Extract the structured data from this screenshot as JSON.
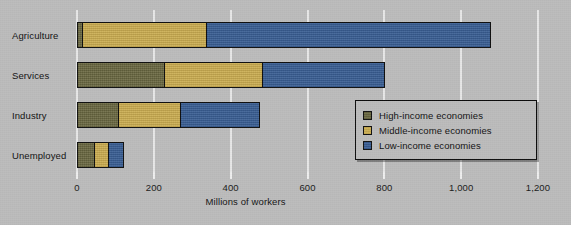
{
  "chart_data": {
    "type": "bar",
    "orientation": "horizontal",
    "stacked": true,
    "title": "",
    "xlabel": "Millions of workers",
    "ylabel": "",
    "xlim": [
      0,
      1200
    ],
    "xticks": [
      0,
      200,
      400,
      600,
      800,
      1000,
      1200
    ],
    "xtick_labels": [
      "0",
      "200",
      "400",
      "600",
      "800",
      "1,000",
      "1,200"
    ],
    "grid": true,
    "legend_position": "center-right",
    "categories": [
      "Agriculture",
      "Services",
      "Industry",
      "Unemployed"
    ],
    "series": [
      {
        "name": "High-income economies",
        "color": "#6b6942",
        "values": [
          10,
          226,
          104,
          44
        ]
      },
      {
        "name": "Middle-income economies",
        "color": "#cfb052",
        "values": [
          325,
          255,
          164,
          37
        ]
      },
      {
        "name": "Low-income economies",
        "color": "#3a5f96",
        "values": [
          742,
          320,
          208,
          41
        ]
      }
    ],
    "totals": [
      1077,
      801,
      476,
      122
    ]
  },
  "legend": {
    "items": [
      {
        "label": "High-income economies",
        "color": "#6b6942"
      },
      {
        "label": "Middle-income economies",
        "color": "#cfb052"
      },
      {
        "label": "Low-income economies",
        "color": "#3a5f96"
      }
    ]
  },
  "colors": {
    "background": "#bcbcbc",
    "gridline": "#e8e8e8",
    "text": "#141414",
    "bar_outline": "#101010",
    "high_income": "#6b6942",
    "middle_income": "#cfb052",
    "low_income": "#3a5f96"
  }
}
